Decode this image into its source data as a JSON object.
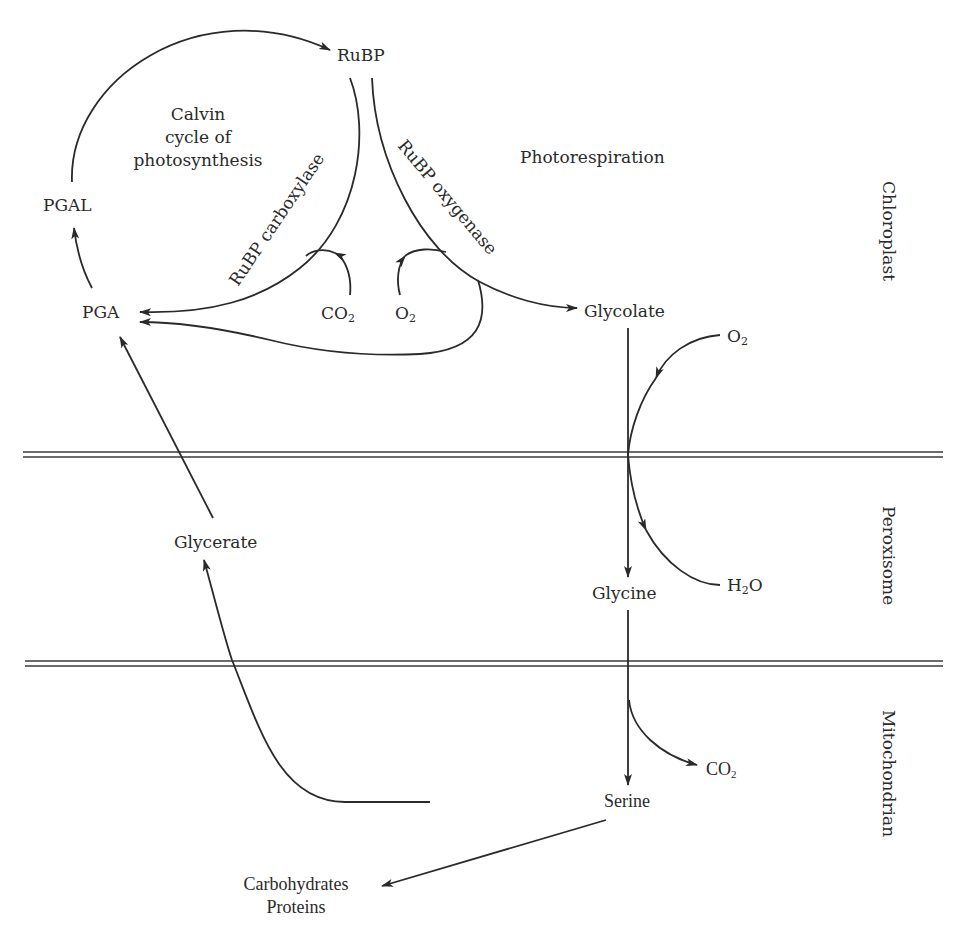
{
  "diagram": {
    "compartments": [
      {
        "name": "Chloroplast",
        "label": "Chloroplast"
      },
      {
        "name": "Peroxisome",
        "label": "Peroxisome"
      },
      {
        "name": "Mitochondrian",
        "label": "Mitochondrian"
      }
    ],
    "region_labels": {
      "calvin_line1": "Calvin",
      "calvin_line2": "cycle of",
      "calvin_line3": "photosynthesis",
      "photorespiration": "Photorespiration"
    },
    "enzymes": {
      "carboxylase": "RuBP  carboxylase",
      "oxygenase": "RuBP  oxygenase"
    },
    "nodes": {
      "rubp": "RuBP",
      "pgal": "PGAL",
      "pga": "PGA",
      "co2_in": "CO",
      "co2_in_sub": "2",
      "o2_in": "O",
      "o2_in_sub": "2",
      "glycolate": "Glycolate",
      "o2_perox": "O",
      "o2_perox_sub": "2",
      "h2o_h": "H",
      "h2o_sub": "2",
      "h2o_o": "O",
      "glycine": "Glycine",
      "glycerate": "Glycerate",
      "co2_out": "CO",
      "co2_out_sub": "2",
      "serine": "Serine",
      "products_line1": "Carbohydrates",
      "products_line2": "Proteins"
    },
    "edges": [
      {
        "from": "PGA",
        "to": "PGAL"
      },
      {
        "from": "PGAL",
        "to": "RuBP"
      },
      {
        "from": "RuBP",
        "to": "PGA",
        "via": "RuBP carboxylase",
        "cofactor": "CO2"
      },
      {
        "from": "RuBP",
        "to": "Glycolate",
        "via": "RuBP oxygenase",
        "cofactor": "O2"
      },
      {
        "from": "RuBP oxygenase",
        "to": "PGA"
      },
      {
        "from": "Glycolate",
        "to": "Glycine",
        "cofactor_in": "O2",
        "cofactor_out": "H2O"
      },
      {
        "from": "Glycine",
        "to": "Serine",
        "cofactor_out": "CO2"
      },
      {
        "from": "Serine",
        "to": "Glycerate"
      },
      {
        "from": "Glycerate",
        "to": "PGA"
      },
      {
        "from": "Serine",
        "to": "Carbohydrates, Proteins"
      }
    ]
  }
}
